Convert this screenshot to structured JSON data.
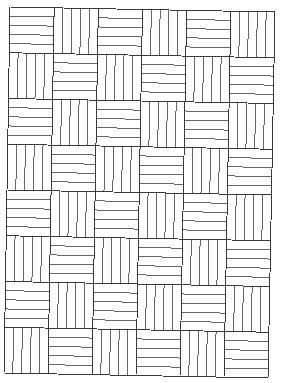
{
  "pattern": {
    "name": "basket-weave grid",
    "columns": 6,
    "rows": 8,
    "strips_per_cell": 5,
    "first_cell_orientation": "horizontal",
    "line_color": "#3a3a3a",
    "background_color": "#ffffff",
    "corners": {
      "top_left": [
        10,
        7
      ],
      "top_right": [
        275,
        12
      ],
      "bottom_left": [
        4,
        373
      ],
      "bottom_right": [
        268,
        378
      ]
    }
  }
}
